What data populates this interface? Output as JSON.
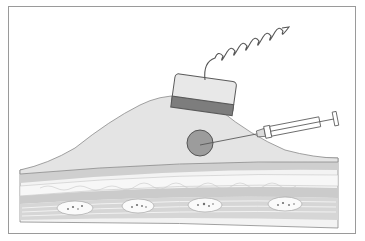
{
  "figure": {
    "elements": [
      {
        "id": "ultrasound-probe",
        "label": "Ultrasound probe"
      },
      {
        "id": "probe-cable",
        "label": "Coiled probe cable"
      },
      {
        "id": "syringe",
        "label": "Syringe with needle"
      },
      {
        "id": "target-lesion",
        "label": "Target (circular lesion)"
      },
      {
        "id": "soft-tissue-mound",
        "label": "Soft tissue swelling"
      },
      {
        "id": "tissue-layers",
        "label": "Underlying tissue layers"
      }
    ],
    "colors": {
      "frame": "#9a9a9a",
      "mound_fill": "#e4e4e4",
      "probe_body": "#e8e8e8",
      "probe_band": "#7d7d7d",
      "target_fill": "#9c9c9c",
      "layer_dark": "#c9c9c9",
      "layer_light": "#f0f0f0",
      "outline": "#6a6a6a"
    }
  }
}
